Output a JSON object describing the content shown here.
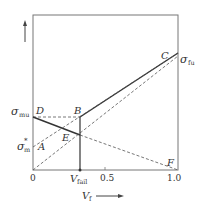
{
  "diagram": {
    "type": "composite-strength-vs-fiber-volume-fraction",
    "y_axis": {
      "arrow": "up-arrow",
      "labels": {
        "sigma_mu": {
          "main": "σ",
          "sub": "mu"
        },
        "sigma_m_star": {
          "main": "σ",
          "sub": "m",
          "sup": "*"
        },
        "sigma_fu": {
          "main": "σ",
          "sub": "fu"
        }
      }
    },
    "x_axis": {
      "label": {
        "main": "V",
        "sub": "f"
      },
      "arrow": "right-arrow",
      "ticks": [
        "0",
        "0.5",
        "1.0"
      ],
      "v_fail": {
        "main": "V",
        "sub": "fail"
      }
    },
    "points": {
      "A": "A",
      "B": "B",
      "C": "C",
      "D": "D",
      "E": "E",
      "F": "F"
    },
    "lines": [
      {
        "name": "D-B",
        "style": "dashed"
      },
      {
        "name": "D-E",
        "style": "solid-thick"
      },
      {
        "name": "E-F",
        "style": "dashed"
      },
      {
        "name": "B-C",
        "style": "solid-thick"
      },
      {
        "name": "A-C",
        "style": "dashed"
      },
      {
        "name": "O-C",
        "style": "dashed"
      },
      {
        "name": "B-Vfail",
        "style": "solid"
      }
    ]
  }
}
